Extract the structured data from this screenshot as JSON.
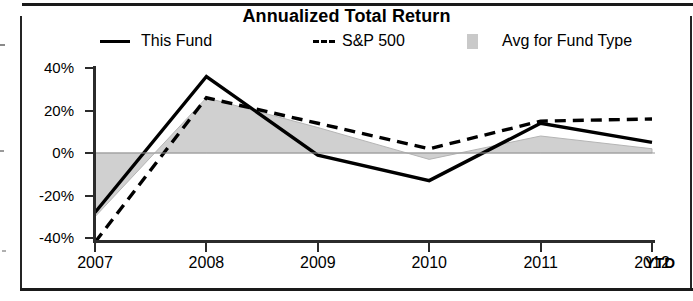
{
  "chart_data": {
    "type": "line",
    "title": "Annualized Total Return",
    "xlabel": "",
    "ylabel": "",
    "x": [
      "2007",
      "2008",
      "2009",
      "2010",
      "2011",
      "2012"
    ],
    "x_suffix_label": "YTD",
    "ylim": [
      -40,
      40
    ],
    "yticks": [
      40,
      20,
      0,
      -20,
      -40
    ],
    "ytick_labels": [
      "40%",
      "20%",
      "0%",
      "-20%",
      "-40%"
    ],
    "grid": false,
    "zero_line": true,
    "legend_position": "top",
    "series": [
      {
        "name": "This Fund",
        "style": "solid",
        "color": "#000000",
        "values": [
          -28,
          36,
          -1,
          -13,
          14,
          5
        ]
      },
      {
        "name": "S&P 500",
        "style": "dashed",
        "color": "#000000",
        "values": [
          -42,
          26,
          14,
          2,
          15,
          16
        ]
      },
      {
        "name": "Avg for Fund Type",
        "style": "shaded-band",
        "color": "#c9c9c9",
        "values": [
          -30,
          26,
          12,
          -3,
          8,
          2
        ]
      }
    ]
  },
  "chart": {
    "title": "Annualized Total Return",
    "ytd_label": "YTD",
    "ytick_labels": [
      "40%",
      "20%",
      "0%",
      "-20%",
      "-40%"
    ],
    "xtick_labels": [
      "2007",
      "2008",
      "2009",
      "2010",
      "2011",
      "2012"
    ]
  },
  "legend": {
    "items": [
      {
        "label": "This Fund",
        "marker": "solid-line-swatch"
      },
      {
        "label": "S&P 500",
        "marker": "dashed-line-swatch"
      },
      {
        "label": "Avg for Fund Type",
        "marker": "shaded-box-swatch"
      }
    ]
  }
}
